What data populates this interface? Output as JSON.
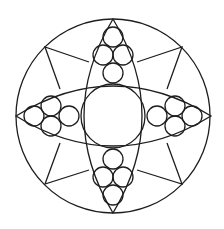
{
  "diagram": {
    "title": "",
    "stroke_color": "#1e1e1e",
    "background": "#ffffff",
    "outer_circle": {
      "cx": 113,
      "cy": 116,
      "r": 97
    },
    "center_circle": {
      "cx": 113,
      "cy": 116,
      "r": 32
    },
    "lenses": [
      {
        "name": "vertical-lens",
        "path": "M113,19 Q171,116 113,213 Q55,116 113,19 Z"
      },
      {
        "name": "horizontal-lens",
        "path": "M16,116 Q113,56 211,116 Q113,176 16,116 Z"
      }
    ],
    "small_circles": [
      {
        "group": "top",
        "cx": 113,
        "cy": 37,
        "r": 10
      },
      {
        "group": "top",
        "cx": 103,
        "cy": 55,
        "r": 10
      },
      {
        "group": "top",
        "cx": 123,
        "cy": 55,
        "r": 10
      },
      {
        "group": "top",
        "cx": 113,
        "cy": 73,
        "r": 10
      },
      {
        "group": "bottom",
        "cx": 113,
        "cy": 159,
        "r": 10
      },
      {
        "group": "bottom",
        "cx": 103,
        "cy": 177,
        "r": 10
      },
      {
        "group": "bottom",
        "cx": 123,
        "cy": 177,
        "r": 10
      },
      {
        "group": "bottom",
        "cx": 113,
        "cy": 195,
        "r": 10
      },
      {
        "group": "left",
        "cx": 34,
        "cy": 116,
        "r": 10
      },
      {
        "group": "left",
        "cx": 51,
        "cy": 106,
        "r": 10
      },
      {
        "group": "left",
        "cx": 51,
        "cy": 126,
        "r": 10
      },
      {
        "group": "left",
        "cx": 69,
        "cy": 116,
        "r": 10
      },
      {
        "group": "right",
        "cx": 157,
        "cy": 116,
        "r": 10
      },
      {
        "group": "right",
        "cx": 175,
        "cy": 106,
        "r": 10
      },
      {
        "group": "right",
        "cx": 175,
        "cy": 126,
        "r": 10
      },
      {
        "group": "right",
        "cx": 192,
        "cy": 116,
        "r": 10
      }
    ],
    "kites": [
      {
        "name": "kite-top-left",
        "points": "89,62 45,47 60,89"
      },
      {
        "name": "kite-top-right",
        "points": "137,62 182,47 167,89"
      },
      {
        "name": "kite-bottom-left",
        "points": "89,170 45,184 60,143"
      },
      {
        "name": "kite-bottom-right",
        "points": "137,170 182,184 167,143"
      }
    ]
  }
}
